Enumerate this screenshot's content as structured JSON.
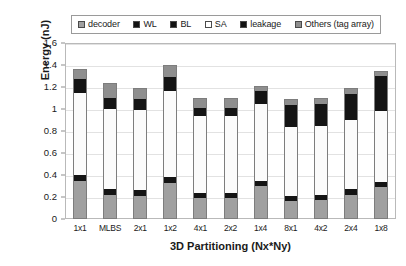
{
  "chart_data": {
    "type": "bar",
    "subtype": "stacked-bar",
    "title": "",
    "xlabel": "3D Partitioning (Nx*Ny)",
    "ylabel": "Energy (nJ)",
    "ylim": [
      0,
      1.6
    ],
    "ytick_labels": [
      "0",
      "0.2",
      "0.4",
      "0.6",
      "0.8",
      "1",
      "1.2",
      "1.4",
      "1.6"
    ],
    "ytick_values": [
      0,
      0.2,
      0.4,
      0.6,
      0.8,
      1.0,
      1.2,
      1.4,
      1.6
    ],
    "grid": true,
    "legend_position": "top",
    "categories": [
      "1x1",
      "MLBS",
      "2x1",
      "1x2",
      "4x1",
      "2x2",
      "1x4",
      "8x1",
      "4x2",
      "2x4",
      "1x8"
    ],
    "series": [
      {
        "name": "decoder",
        "color": "#a0a0a0",
        "values": [
          0.35,
          0.22,
          0.21,
          0.33,
          0.19,
          0.19,
          0.3,
          0.16,
          0.17,
          0.22,
          0.29
        ]
      },
      {
        "name": "BL",
        "color": "#141414",
        "values": [
          0.05,
          0.05,
          0.05,
          0.05,
          0.05,
          0.05,
          0.05,
          0.05,
          0.05,
          0.05,
          0.05
        ]
      },
      {
        "name": "SA",
        "color": "#fbfbfb",
        "values": [
          0.75,
          0.73,
          0.73,
          0.78,
          0.7,
          0.7,
          0.7,
          0.63,
          0.63,
          0.63,
          0.64
        ]
      },
      {
        "name": "WL",
        "color": "#141414",
        "values": [
          0.12,
          0.1,
          0.1,
          0.13,
          0.07,
          0.07,
          0.11,
          0.2,
          0.2,
          0.24,
          0.32
        ]
      },
      {
        "name": "Others (tag array)",
        "color": "#8e8e8e",
        "values": [
          0.09,
          0.14,
          0.1,
          0.11,
          0.09,
          0.09,
          0.05,
          0.05,
          0.05,
          0.05,
          0.05
        ]
      }
    ],
    "totals": [
      1.36,
      1.24,
      1.19,
      1.4,
      1.1,
      1.1,
      1.21,
      1.09,
      1.1,
      1.19,
      1.35
    ]
  },
  "legend": {
    "items": [
      {
        "label": "decoder",
        "color": "#a0a0a0"
      },
      {
        "label": "WL",
        "color": "#141414"
      },
      {
        "label": "BL",
        "color": "#141414"
      },
      {
        "label": "SA",
        "color": "#fbfbfb"
      },
      {
        "label": "leakage",
        "color": "#141414"
      },
      {
        "label": "Others (tag array)",
        "color": "#8e8e8e"
      }
    ]
  },
  "axes": {
    "y_title": "Energy (nJ)",
    "x_title": "3D Partitioning (Nx*Ny)"
  }
}
